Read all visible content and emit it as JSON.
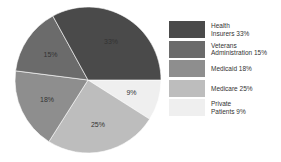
{
  "chart_data": {
    "type": "pie",
    "title": "",
    "categories": [
      "Health Insurers",
      "Veterans Administration",
      "Medicaid",
      "Medicare",
      "Private Patients"
    ],
    "values": [
      33,
      15,
      18,
      25,
      9
    ],
    "unit": "%",
    "slice_labels": [
      "33%",
      "15%",
      "18%",
      "25%",
      "9%"
    ],
    "colors": [
      "#4a4a4a",
      "#6b6b6b",
      "#8e8e8e",
      "#bdbdbd",
      "#efefef"
    ],
    "start_angle_deg": 90,
    "direction": "clockwise-from-3-oclock: Private Patients, Medicare, Medicaid, Veterans Administration, Health Insurers",
    "legend_position": "right",
    "legend": [
      {
        "line1": "Health",
        "line2": "Insurers 33%"
      },
      {
        "line1": "Veterans",
        "line2": "Administration 15%"
      },
      {
        "line1": "Medicaid 18%",
        "line2": ""
      },
      {
        "line1": "Medicare 25%",
        "line2": ""
      },
      {
        "line1": "Private",
        "line2": "Patients 9%"
      }
    ]
  }
}
